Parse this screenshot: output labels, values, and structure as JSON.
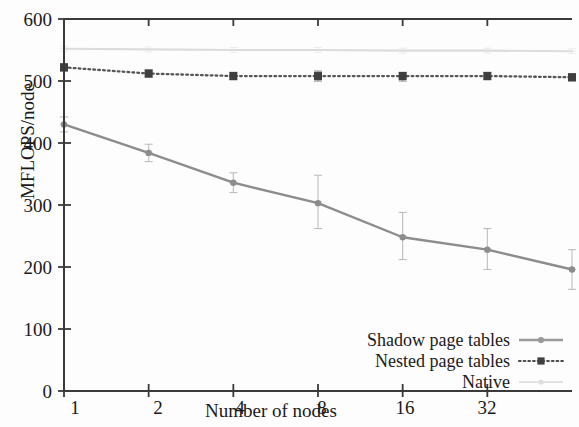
{
  "chart_data": {
    "type": "line",
    "title": "",
    "xlabel": "Number of nodes",
    "ylabel": "MFLOPS/node",
    "xscale": "log2",
    "x": [
      1,
      2,
      4,
      8,
      16,
      32,
      64
    ],
    "xtick_labels": [
      "1",
      "2",
      "4",
      "8",
      "16",
      "32"
    ],
    "xticks": [
      1,
      2,
      4,
      8,
      16,
      32
    ],
    "xlim": [
      1,
      64
    ],
    "ytick_labels": [
      "0",
      "100",
      "200",
      "300",
      "400",
      "500",
      "600"
    ],
    "yticks": [
      0,
      100,
      200,
      300,
      400,
      500,
      600
    ],
    "ylim": [
      0,
      600
    ],
    "grid": false,
    "legend_position": "lower right",
    "series": [
      {
        "name": "Shadow page tables",
        "style": "solid",
        "color": "#8c8c8c",
        "marker": "circle",
        "values": [
          430,
          384,
          336,
          303,
          248,
          228,
          196
        ],
        "err_low": [
          418,
          370,
          320,
          262,
          212,
          196,
          164
        ],
        "err_high": [
          442,
          398,
          352,
          348,
          288,
          262,
          228
        ]
      },
      {
        "name": "Nested page tables",
        "style": "dotted",
        "color": "#555555",
        "marker": "square",
        "values": [
          522,
          512,
          508,
          508,
          508,
          508,
          506
        ],
        "err_low": [
          516,
          506,
          502,
          500,
          500,
          502,
          500
        ],
        "err_high": [
          528,
          518,
          514,
          516,
          514,
          514,
          512
        ]
      },
      {
        "name": "Native",
        "style": "faint",
        "color": "#dcdcdc",
        "marker": "none",
        "values": [
          552,
          551,
          550,
          550,
          549,
          549,
          548
        ],
        "err_low": [
          548,
          547,
          546,
          546,
          545,
          545,
          544
        ],
        "err_high": [
          556,
          555,
          554,
          554,
          553,
          553,
          552
        ]
      }
    ]
  },
  "axes": {
    "ylabel": "MFLOPS/node",
    "xlabel": "Number of nodes",
    "ytick_labels": [
      "600",
      "500",
      "400",
      "300",
      "200",
      "100",
      "0"
    ],
    "xtick_labels": [
      "1",
      "2",
      "4",
      "8",
      "16",
      "32"
    ]
  },
  "legend": {
    "items": [
      {
        "label": "Shadow page tables",
        "key": "solid-line-with-circle-marker"
      },
      {
        "label": "Nested page tables",
        "key": "dotted-line-with-square-marker"
      },
      {
        "label": "Native",
        "key": "faint-line"
      }
    ]
  }
}
